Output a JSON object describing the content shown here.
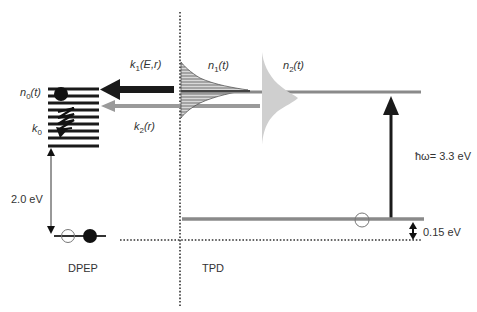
{
  "diagram": {
    "type": "energy-level-diagram",
    "regions": {
      "left": {
        "label": "DPEP"
      },
      "right": {
        "label": "TPD"
      }
    },
    "labels": {
      "n0": "n",
      "n0_sub": "0",
      "n0_arg": "(t)",
      "k0": "k",
      "k0_sub": "0",
      "k1": "k",
      "k1_sub": "1",
      "k1_arg": "(E,r)",
      "k2": "k",
      "k2_sub": "2",
      "k2_arg": "(r)",
      "n1": "n",
      "n1_sub": "1",
      "n1_arg": "(t)",
      "n2": "n",
      "n2_sub": "2",
      "n2_arg": "(t)",
      "gap_dpep": "2.0 eV",
      "photon": "ħω= 3.3 eV",
      "offset": "0.15 eV"
    },
    "colors": {
      "dark": "#1a1a1a",
      "gray_level": "#8a8a8a",
      "light_gray_arrow": "#9a9a9a",
      "n2_fill": "#cfcfcf",
      "dotted": "#333333"
    }
  }
}
